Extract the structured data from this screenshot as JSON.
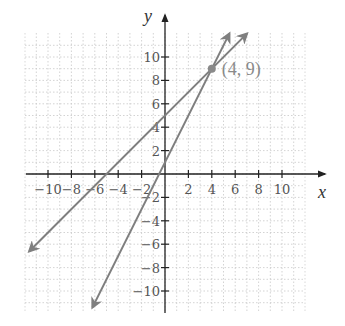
{
  "chart_data": {
    "type": "line",
    "title": "",
    "xlabel": "x",
    "ylabel": "y",
    "xlim": [
      -11.9,
      12
    ],
    "ylim": [
      -11.9,
      12
    ],
    "grid": true,
    "x_ticks": [
      -10,
      -8,
      -6,
      -4,
      -2,
      2,
      4,
      6,
      8,
      10
    ],
    "y_ticks": [
      -10,
      -8,
      -6,
      -4,
      -2,
      2,
      4,
      6,
      8,
      10
    ],
    "x_tick_labels": [
      "−10",
      "−8",
      "−6",
      "−4",
      "−2",
      "2",
      "4",
      "6",
      "8",
      "10"
    ],
    "y_tick_labels": [
      "−10",
      "−8",
      "−6",
      "−4",
      "−2",
      "2",
      "4",
      "6",
      "8",
      "10"
    ],
    "series": [
      {
        "name": "y = x + 5",
        "slope": 1,
        "intercept": 5,
        "x": [
          -11.6,
          7
        ],
        "y": [
          -6.6,
          12
        ],
        "color": "#7f7f7f"
      },
      {
        "name": "y = 2x + 1",
        "slope": 2,
        "intercept": 1,
        "x": [
          -6.2,
          5.5
        ],
        "y": [
          -11.4,
          12
        ],
        "color": "#7f7f7f"
      }
    ],
    "annotations": [
      {
        "type": "point",
        "x": 4,
        "y": 9,
        "label": "(4, 9)",
        "color": "#8a8a8a"
      }
    ],
    "legend": null
  },
  "labels": {
    "x_axis": "x",
    "y_axis": "y",
    "intersection": "(4, 9)"
  }
}
